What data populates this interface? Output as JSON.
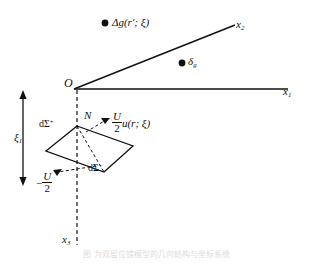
{
  "figure": {
    "type": "geometry-diagram",
    "background_color": "#ffffff",
    "line_color": "#111111",
    "caption": "图              为双层位错模型的几何结构与坐标系统"
  },
  "axes": {
    "origin_label": "O",
    "x1_label": "x",
    "x1_sub": "1",
    "x2_label": "x",
    "x2_sub": "2",
    "x3_label": "x",
    "x3_sub": "3"
  },
  "labels": {
    "normal": "N",
    "xi1": "ξ",
    "xi1_sub": "1",
    "delta_g": "Δg(r′;  ξ)",
    "delta_sub_g": "δ",
    "delta_sub_g_sub": "g",
    "d_sigma_plus_base": "dΣ",
    "d_sigma_plus_sup": "+",
    "d_sigma_minus_base": "dΣ",
    "d_sigma_minus_sup": "−",
    "u_numerator": "U",
    "u_denominator": "2",
    "u_function": "u(r;  ξ)",
    "minus_sign": "−"
  }
}
